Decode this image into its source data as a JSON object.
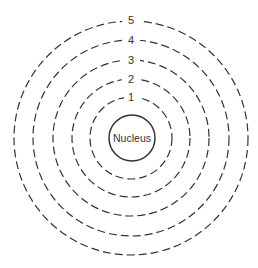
{
  "diagram": {
    "type": "atomic shell model",
    "center": {
      "x": 131,
      "y": 138
    },
    "nucleus": {
      "label": "Nucleus",
      "radius": 23
    },
    "shells": [
      {
        "label": "1",
        "radius": 41
      },
      {
        "label": "2",
        "radius": 59
      },
      {
        "label": "3",
        "radius": 78
      },
      {
        "label": "4",
        "radius": 98
      },
      {
        "label": "5",
        "radius": 117
      }
    ],
    "colors": {
      "stroke": "#333333",
      "background": "#ffffff"
    }
  }
}
